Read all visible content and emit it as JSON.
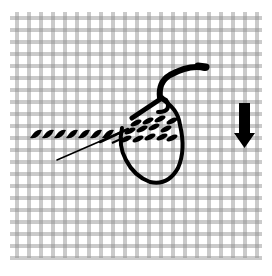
{
  "diagram": {
    "canvas": {
      "x0": 10,
      "y0": 12,
      "x1": 262,
      "y1": 258,
      "spacing": 12,
      "thread_color": "#8a8a8a",
      "thread_gap": 2
    },
    "ink_color": "#000000",
    "background": "#ffffff",
    "elements": {
      "completed_stitches": {
        "count": 7,
        "label": "worked stitches row"
      },
      "upper_stitches": {
        "count": 5,
        "label": "stitches behind needle"
      },
      "lower_stitches": {
        "count": 5,
        "label": "stitches under yarn loop"
      },
      "needle": {
        "label": "needle"
      },
      "yarn_loop": {
        "label": "yarn loop"
      },
      "direction_arrow": {
        "label": "down arrow",
        "direction": "down"
      }
    }
  }
}
